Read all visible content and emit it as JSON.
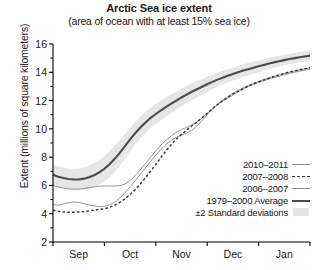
{
  "chart_data": {
    "type": "line",
    "title": "Arctic Sea ice extent",
    "subtitle": "(area of ocean with at least 15% sea ice)",
    "xlabel": "",
    "ylabel": "Extent (millions of square kilometers)",
    "ylim": [
      2,
      16
    ],
    "yticks": [
      16,
      14,
      12,
      10,
      8,
      6,
      4,
      2
    ],
    "xticks": [
      "Sep",
      "Oct",
      "Nov",
      "Dec",
      "Jan"
    ],
    "grid": false,
    "legend_position": "lower-right",
    "x": [
      0,
      0.1,
      0.2,
      0.3,
      0.4,
      0.5,
      0.6,
      0.7,
      0.8,
      0.9,
      1.0,
      1.1,
      1.2,
      1.3,
      1.4,
      1.5,
      1.6,
      1.7,
      1.8,
      1.9,
      2.0,
      2.1,
      2.2,
      2.3,
      2.4,
      2.5,
      2.6,
      2.7,
      2.8,
      2.9,
      3.0,
      3.1,
      3.2,
      3.3,
      3.4,
      3.5,
      3.6,
      3.7,
      3.8,
      3.9,
      4.0,
      4.1,
      4.2,
      4.3,
      4.4,
      4.5,
      4.6,
      4.7,
      4.8,
      4.9,
      5.0
    ],
    "series": [
      {
        "name": "1979–2000 Average",
        "style": "thick-solid",
        "color": "#4a4a4a",
        "values": [
          6.75,
          6.62,
          6.52,
          6.45,
          6.42,
          6.42,
          6.48,
          6.58,
          6.72,
          6.92,
          7.18,
          7.5,
          7.88,
          8.3,
          8.78,
          9.25,
          9.7,
          10.1,
          10.45,
          10.78,
          11.05,
          11.3,
          11.55,
          11.78,
          12.0,
          12.22,
          12.42,
          12.62,
          12.8,
          12.98,
          13.15,
          13.32,
          13.48,
          13.62,
          13.75,
          13.88,
          14.0,
          14.12,
          14.22,
          14.32,
          14.42,
          14.52,
          14.62,
          14.7,
          14.78,
          14.86,
          14.94,
          15.0,
          15.06,
          15.12,
          15.18
        ]
      },
      {
        "name": "±2 Standard deviations (upper)",
        "style": "band-edge",
        "color": "#e4e4e4",
        "values": [
          7.5,
          7.38,
          7.28,
          7.2,
          7.18,
          7.2,
          7.28,
          7.4,
          7.58,
          7.8,
          8.08,
          8.42,
          8.8,
          9.2,
          9.65,
          10.08,
          10.5,
          10.88,
          11.2,
          11.5,
          11.76,
          12.0,
          12.24,
          12.45,
          12.65,
          12.85,
          13.03,
          13.21,
          13.38,
          13.54,
          13.69,
          13.84,
          13.98,
          14.1,
          14.22,
          14.34,
          14.45,
          14.56,
          14.66,
          14.75,
          14.84,
          14.93,
          15.02,
          15.1,
          15.17,
          15.24,
          15.31,
          15.37,
          15.43,
          15.49,
          15.55
        ]
      },
      {
        "name": "±2 Standard deviations (lower)",
        "style": "band-edge",
        "color": "#e4e4e4",
        "values": [
          6.0,
          5.86,
          5.76,
          5.7,
          5.66,
          5.64,
          5.68,
          5.76,
          5.86,
          6.04,
          6.28,
          6.58,
          6.96,
          7.4,
          7.91,
          8.42,
          8.9,
          9.32,
          9.7,
          10.06,
          10.34,
          10.6,
          10.86,
          11.11,
          11.35,
          11.59,
          11.81,
          12.03,
          12.22,
          12.42,
          12.61,
          12.8,
          12.98,
          13.14,
          13.28,
          13.42,
          13.55,
          13.68,
          13.78,
          13.89,
          14.0,
          14.11,
          14.22,
          14.3,
          14.39,
          14.48,
          14.57,
          14.63,
          14.69,
          14.75,
          14.81
        ]
      },
      {
        "name": "2006–2007",
        "style": "thin-solid",
        "color": "#8c8c8c",
        "values": [
          6.0,
          5.9,
          5.82,
          5.76,
          5.74,
          5.74,
          5.78,
          5.84,
          5.9,
          5.94,
          5.96,
          5.96,
          5.96,
          5.98,
          6.1,
          6.35,
          6.7,
          7.1,
          7.55,
          8.0,
          8.45,
          8.85,
          9.2,
          9.5,
          9.75,
          9.95,
          10.1,
          10.28,
          10.5,
          10.78,
          11.1,
          11.42,
          11.7,
          11.95,
          12.18,
          12.4,
          12.62,
          12.82,
          13.0,
          13.15,
          13.28,
          13.4,
          13.52,
          13.62,
          13.72,
          13.82,
          13.92,
          14.0,
          14.08,
          14.15,
          14.22
        ]
      },
      {
        "name": "2010–2011",
        "style": "thin-solid",
        "color": "#8c8c8c",
        "values": [
          4.65,
          4.6,
          4.68,
          4.78,
          4.82,
          4.8,
          4.72,
          4.62,
          4.55,
          4.5,
          4.52,
          4.62,
          4.82,
          5.1,
          5.48,
          5.9,
          6.35,
          6.8,
          7.25,
          7.7,
          8.15,
          8.55,
          8.9,
          9.18,
          9.4,
          9.55,
          9.7,
          9.9,
          10.2,
          10.58,
          11.0,
          11.4,
          11.75,
          12.05,
          12.3,
          12.52,
          12.72,
          12.9,
          13.08,
          13.22,
          13.35,
          13.48,
          13.6,
          13.7,
          13.8,
          13.9,
          14.0,
          14.08,
          14.16,
          14.24,
          14.3
        ]
      },
      {
        "name": "2007–2008",
        "style": "dashed",
        "color": "#3a3a3a",
        "values": [
          4.25,
          4.18,
          4.12,
          4.1,
          4.1,
          4.12,
          4.15,
          4.2,
          4.25,
          4.3,
          4.35,
          4.45,
          4.6,
          4.8,
          5.05,
          5.35,
          5.7,
          6.1,
          6.55,
          7.0,
          7.5,
          7.98,
          8.45,
          8.88,
          9.28,
          9.62,
          9.92,
          10.2,
          10.48,
          10.78,
          11.1,
          11.42,
          11.72,
          11.98,
          12.22,
          12.45,
          12.65,
          12.85,
          13.02,
          13.18,
          13.32,
          13.46,
          13.58,
          13.7,
          13.82,
          13.92,
          14.02,
          14.1,
          14.18,
          14.26,
          14.34
        ]
      }
    ],
    "legend": [
      {
        "label": "2010–2011",
        "sample": "thin-line"
      },
      {
        "label": "2007–2008",
        "sample": "dashed-line"
      },
      {
        "label": "2006–2007",
        "sample": "thin-line"
      },
      {
        "label": "1979–2000 Average",
        "sample": "thick-line"
      },
      {
        "label": "±2 Standard deviations",
        "sample": "band-swatch"
      }
    ]
  }
}
